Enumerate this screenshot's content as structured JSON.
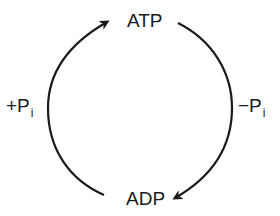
{
  "diagram": {
    "type": "cycle",
    "nodes": {
      "top": "ATP",
      "bottom": "ADP"
    },
    "edges": {
      "left": {
        "sign": "+",
        "base": "P",
        "subscript": "i",
        "from": "ADP",
        "to": "ATP"
      },
      "right": {
        "sign": "−",
        "base": "P",
        "subscript": "i",
        "from": "ATP",
        "to": "ADP"
      }
    },
    "colors": {
      "stroke": "#1a1a1a",
      "background": "#ffffff"
    }
  }
}
